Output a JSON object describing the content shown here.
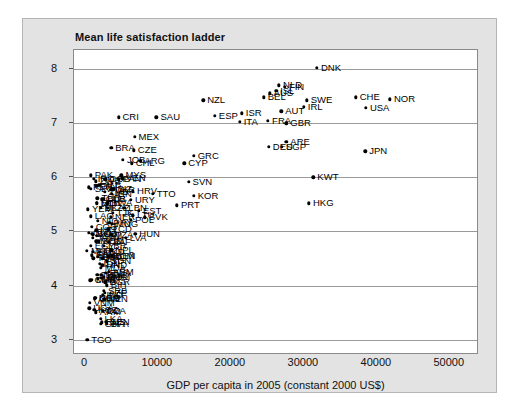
{
  "chart_title": "Mean life satisfaction ladder",
  "chart_data": {
    "type": "scatter",
    "title": "Mean life satisfaction ladder",
    "xlabel": "GDP per capita in 2005 (constant 2000 US$)",
    "ylabel": "Mean life satisfaction ladder",
    "xlim": [
      -1500,
      54000
    ],
    "ylim": [
      2.72,
      8.35
    ],
    "xticks": [
      0,
      10000,
      20000,
      30000,
      40000,
      50000
    ],
    "xticklabels": [
      "0",
      "10000",
      "20000",
      "30000",
      "40000",
      "50000"
    ],
    "yticks": [
      3,
      4,
      5,
      6,
      7,
      8
    ],
    "yticklabels": [
      "3",
      "4",
      "5",
      "6",
      "7",
      "8"
    ],
    "grid": "horizontal",
    "legend": "none",
    "points": [
      {
        "label": "DNK",
        "x": 31800,
        "y": 8.02,
        "lp": "right"
      },
      {
        "label": "FIN",
        "x": 27400,
        "y": 7.67,
        "lp": "right"
      },
      {
        "label": "NLD",
        "x": 26600,
        "y": 7.7,
        "lp": "right"
      },
      {
        "label": "ISL",
        "x": 26200,
        "y": 7.6,
        "lp": "right"
      },
      {
        "label": "AUS",
        "x": 25300,
        "y": 7.55,
        "lp": "right"
      },
      {
        "label": "BEL",
        "x": 24500,
        "y": 7.48,
        "lp": "right"
      },
      {
        "label": "SWE",
        "x": 30400,
        "y": 7.42,
        "lp": "right"
      },
      {
        "label": "CHE",
        "x": 37100,
        "y": 7.48,
        "lp": "right"
      },
      {
        "label": "NOR",
        "x": 41800,
        "y": 7.44,
        "lp": "right"
      },
      {
        "label": "IRL",
        "x": 30000,
        "y": 7.3,
        "lp": "right"
      },
      {
        "label": "USA",
        "x": 38500,
        "y": 7.28,
        "lp": "right"
      },
      {
        "label": "AUT",
        "x": 26900,
        "y": 7.22,
        "lp": "right"
      },
      {
        "label": "NZL",
        "x": 16200,
        "y": 7.42,
        "lp": "right"
      },
      {
        "label": "ESP",
        "x": 17800,
        "y": 7.14,
        "lp": "right"
      },
      {
        "label": "ISR",
        "x": 21500,
        "y": 7.18,
        "lp": "right"
      },
      {
        "label": "ITA",
        "x": 21200,
        "y": 7.02,
        "lp": "right"
      },
      {
        "label": "CRI",
        "x": 4600,
        "y": 7.11,
        "lp": "right"
      },
      {
        "label": "SAU",
        "x": 9800,
        "y": 7.11,
        "lp": "right"
      },
      {
        "label": "FRA",
        "x": 25100,
        "y": 7.04,
        "lp": "right"
      },
      {
        "label": "GBR",
        "x": 27600,
        "y": 7.0,
        "lp": "right"
      },
      {
        "label": "ARE",
        "x": 27600,
        "y": 6.66,
        "lp": "right"
      },
      {
        "label": "DEU",
        "x": 25200,
        "y": 6.56,
        "lp": "right"
      },
      {
        "label": "SGP",
        "x": 27000,
        "y": 6.56,
        "lp": "right"
      },
      {
        "label": "MEX",
        "x": 6800,
        "y": 6.75,
        "lp": "right"
      },
      {
        "label": "BRA",
        "x": 3600,
        "y": 6.55,
        "lp": "right"
      },
      {
        "label": "CZE",
        "x": 6700,
        "y": 6.5,
        "lp": "right"
      },
      {
        "label": "GRC",
        "x": 14900,
        "y": 6.4,
        "lp": "right"
      },
      {
        "label": "CYP",
        "x": 13600,
        "y": 6.26,
        "lp": "right"
      },
      {
        "label": "ARG",
        "x": 7600,
        "y": 6.3,
        "lp": "right"
      },
      {
        "label": "JOB",
        "x": 5200,
        "y": 6.32,
        "lp": "right"
      },
      {
        "label": "CHL",
        "x": 6400,
        "y": 6.26,
        "lp": "right"
      },
      {
        "label": "PAK",
        "x": 800,
        "y": 6.04,
        "lp": "right"
      },
      {
        "label": "MYS",
        "x": 5000,
        "y": 6.04,
        "lp": "right"
      },
      {
        "label": "VEN",
        "x": 5100,
        "y": 5.98,
        "lp": "right"
      },
      {
        "label": "COL",
        "x": 2800,
        "y": 5.96,
        "lp": "right"
      },
      {
        "label": "PAN",
        "x": 4600,
        "y": 5.96,
        "lp": "right"
      },
      {
        "label": "KWT",
        "x": 31300,
        "y": 6.0,
        "lp": "right"
      },
      {
        "label": "HKG",
        "x": 30700,
        "y": 5.52,
        "lp": "right"
      },
      {
        "label": "JPN",
        "x": 38400,
        "y": 6.48,
        "lp": "right"
      },
      {
        "label": "SVN",
        "x": 14200,
        "y": 5.92,
        "lp": "right"
      },
      {
        "label": "TTO",
        "x": 9300,
        "y": 5.7,
        "lp": "right"
      },
      {
        "label": "KOR",
        "x": 14900,
        "y": 5.66,
        "lp": "right"
      },
      {
        "label": "PRT",
        "x": 12600,
        "y": 5.48,
        "lp": "right"
      },
      {
        "label": "BLR",
        "x": 2500,
        "y": 5.6,
        "lp": "right"
      },
      {
        "label": "URY",
        "x": 6300,
        "y": 5.58,
        "lp": "right"
      },
      {
        "label": "HRV",
        "x": 6600,
        "y": 5.74,
        "lp": "right"
      },
      {
        "label": "BIZ",
        "x": 3900,
        "y": 5.78,
        "lp": "right"
      },
      {
        "label": "KAZ",
        "x": 3100,
        "y": 5.44,
        "lp": "right"
      },
      {
        "label": "LBN",
        "x": 5400,
        "y": 5.44,
        "lp": "right"
      },
      {
        "label": "EST",
        "x": 7400,
        "y": 5.38,
        "lp": "right"
      },
      {
        "label": "LTU",
        "x": 6600,
        "y": 5.3,
        "lp": "right"
      },
      {
        "label": "SVK",
        "x": 8200,
        "y": 5.26,
        "lp": "right"
      },
      {
        "label": "POL",
        "x": 6300,
        "y": 5.22,
        "lp": "right"
      },
      {
        "label": "LVA",
        "x": 5600,
        "y": 4.88,
        "lp": "right"
      },
      {
        "label": "HUN",
        "x": 6900,
        "y": 4.96,
        "lp": "right"
      },
      {
        "label": "ROM",
        "x": 3200,
        "y": 4.54,
        "lp": "right"
      },
      {
        "label": "BGR",
        "x": 2800,
        "y": 4.06,
        "lp": "right"
      },
      {
        "label": "SRB",
        "x": 2600,
        "y": 3.9,
        "lp": "right"
      },
      {
        "label": "GEO",
        "x": 1400,
        "y": 3.78,
        "lp": "right"
      },
      {
        "label": "TGO",
        "x": 300,
        "y": 3.0,
        "lp": "right"
      }
    ],
    "dense_cluster_note": "Large overprinted cluster of low-GDP countries between y=3 and y=6 at x<4000"
  },
  "axis": {
    "x_title": "GDP per capita in 2005 (constant 2000 US$)"
  }
}
